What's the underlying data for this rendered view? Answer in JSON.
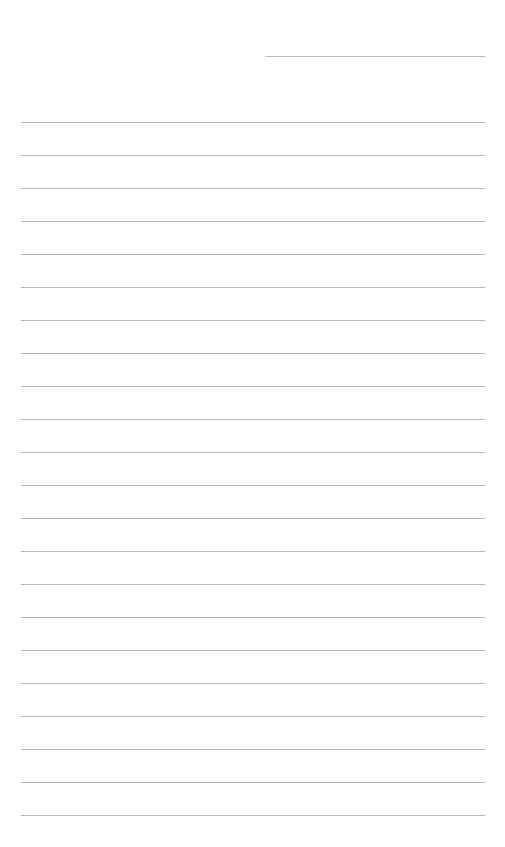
{
  "page": {
    "width": 505,
    "height": 847,
    "background_color": "#ffffff",
    "content_text": "",
    "rule_color": "#b9b9bb",
    "rule_thickness_px": 1,
    "rule_spacing_px": 33,
    "full_rule_left_px": 21,
    "full_rule_right_px": 485,
    "rule_count_total": 23,
    "rule_count_full_width": 22,
    "rule_count_partial_width": 1
  },
  "rules": [
    {
      "name": "rule-header-partial",
      "y": 56,
      "x": 266,
      "width": 219,
      "variant": "partial"
    },
    {
      "name": "rule-01",
      "y": 122,
      "x": 21,
      "width": 464,
      "variant": "full"
    },
    {
      "name": "rule-02",
      "y": 155,
      "x": 21,
      "width": 464,
      "variant": "full"
    },
    {
      "name": "rule-03",
      "y": 188,
      "x": 21,
      "width": 464,
      "variant": "full"
    },
    {
      "name": "rule-04",
      "y": 221,
      "x": 21,
      "width": 464,
      "variant": "full"
    },
    {
      "name": "rule-05",
      "y": 254,
      "x": 21,
      "width": 464,
      "variant": "full"
    },
    {
      "name": "rule-06",
      "y": 287,
      "x": 21,
      "width": 464,
      "variant": "full"
    },
    {
      "name": "rule-07",
      "y": 320,
      "x": 21,
      "width": 464,
      "variant": "full"
    },
    {
      "name": "rule-08",
      "y": 353,
      "x": 21,
      "width": 464,
      "variant": "full"
    },
    {
      "name": "rule-09",
      "y": 386,
      "x": 21,
      "width": 464,
      "variant": "full"
    },
    {
      "name": "rule-10",
      "y": 419,
      "x": 21,
      "width": 464,
      "variant": "full"
    },
    {
      "name": "rule-11",
      "y": 452,
      "x": 21,
      "width": 464,
      "variant": "full"
    },
    {
      "name": "rule-12",
      "y": 485,
      "x": 21,
      "width": 464,
      "variant": "full"
    },
    {
      "name": "rule-13",
      "y": 518,
      "x": 21,
      "width": 464,
      "variant": "full"
    },
    {
      "name": "rule-14",
      "y": 551,
      "x": 21,
      "width": 464,
      "variant": "full"
    },
    {
      "name": "rule-15",
      "y": 584,
      "x": 21,
      "width": 464,
      "variant": "full"
    },
    {
      "name": "rule-16",
      "y": 617,
      "x": 21,
      "width": 464,
      "variant": "full"
    },
    {
      "name": "rule-17",
      "y": 650,
      "x": 21,
      "width": 464,
      "variant": "full"
    },
    {
      "name": "rule-18",
      "y": 683,
      "x": 21,
      "width": 464,
      "variant": "full"
    },
    {
      "name": "rule-19",
      "y": 716,
      "x": 21,
      "width": 464,
      "variant": "full"
    },
    {
      "name": "rule-20",
      "y": 749,
      "x": 21,
      "width": 464,
      "variant": "full"
    },
    {
      "name": "rule-21",
      "y": 782,
      "x": 21,
      "width": 464,
      "variant": "full"
    },
    {
      "name": "rule-22",
      "y": 815,
      "x": 21,
      "width": 464,
      "variant": "full"
    }
  ]
}
